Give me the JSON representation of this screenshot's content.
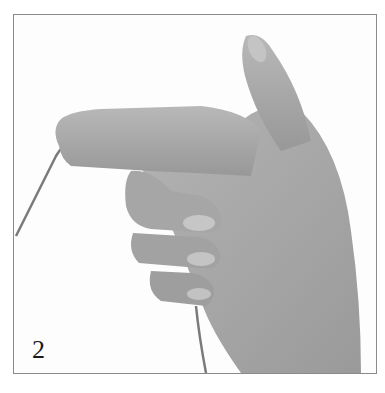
{
  "illustration": {
    "step_number": "2",
    "subject": "hand-holding-yarn",
    "colors": {
      "skin_mid": "#a9a9a9",
      "skin_dark": "#8c8c8c",
      "skin_light": "#c4c4c4",
      "yarn": "#7a7a7a",
      "border": "#8a8a8a",
      "background": "#fdfdfd"
    }
  }
}
